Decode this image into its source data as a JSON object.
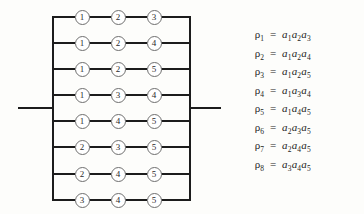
{
  "figure": {
    "type": "series-parallel-circuit-diagram"
  },
  "circuit": {
    "left_terminal_label": "",
    "right_terminal_label": "",
    "columns": 3,
    "rows": [
      {
        "index": 1,
        "nodes": [
          "1",
          "2",
          "3"
        ]
      },
      {
        "index": 2,
        "nodes": [
          "1",
          "2",
          "4"
        ]
      },
      {
        "index": 3,
        "nodes": [
          "1",
          "2",
          "5"
        ]
      },
      {
        "index": 4,
        "nodes": [
          "1",
          "3",
          "4"
        ]
      },
      {
        "index": 5,
        "nodes": [
          "1",
          "4",
          "5"
        ]
      },
      {
        "index": 6,
        "nodes": [
          "2",
          "3",
          "5"
        ]
      },
      {
        "index": 7,
        "nodes": [
          "2",
          "4",
          "5"
        ]
      },
      {
        "index": 8,
        "nodes": [
          "3",
          "4",
          "5"
        ]
      }
    ]
  },
  "equations": [
    {
      "lhs": "ρ",
      "lhs_sub": "1",
      "op": "=",
      "terms": [
        {
          "base": "a",
          "sub": "1"
        },
        {
          "base": "a",
          "sub": "2"
        },
        {
          "base": "a",
          "sub": "3"
        }
      ]
    },
    {
      "lhs": "ρ",
      "lhs_sub": "2",
      "op": "=",
      "terms": [
        {
          "base": "a",
          "sub": "1"
        },
        {
          "base": "a",
          "sub": "2"
        },
        {
          "base": "a",
          "sub": "4"
        }
      ]
    },
    {
      "lhs": "ρ",
      "lhs_sub": "3",
      "op": "=",
      "terms": [
        {
          "base": "a",
          "sub": "1"
        },
        {
          "base": "a",
          "sub": "2"
        },
        {
          "base": "a",
          "sub": "5"
        }
      ]
    },
    {
      "lhs": "ρ",
      "lhs_sub": "4",
      "op": "=",
      "terms": [
        {
          "base": "a",
          "sub": "1"
        },
        {
          "base": "a",
          "sub": "3"
        },
        {
          "base": "a",
          "sub": "4"
        }
      ]
    },
    {
      "lhs": "ρ",
      "lhs_sub": "5",
      "op": "=",
      "terms": [
        {
          "base": "a",
          "sub": "1"
        },
        {
          "base": "a",
          "sub": "4"
        },
        {
          "base": "a",
          "sub": "5"
        }
      ]
    },
    {
      "lhs": "ρ",
      "lhs_sub": "6",
      "op": "=",
      "terms": [
        {
          "base": "a",
          "sub": "2"
        },
        {
          "base": "a",
          "sub": "3"
        },
        {
          "base": "a",
          "sub": "5"
        }
      ]
    },
    {
      "lhs": "ρ",
      "lhs_sub": "7",
      "op": "=",
      "terms": [
        {
          "base": "a",
          "sub": "2"
        },
        {
          "base": "a",
          "sub": "4"
        },
        {
          "base": "a",
          "sub": "5"
        }
      ]
    },
    {
      "lhs": "ρ",
      "lhs_sub": "8",
      "op": "=",
      "terms": [
        {
          "base": "a",
          "sub": "3"
        },
        {
          "base": "a",
          "sub": "4"
        },
        {
          "base": "a",
          "sub": "5"
        }
      ]
    }
  ],
  "colors": {
    "wire": "#1c1c1c",
    "node_outline": "#6e6e6e",
    "node_fill": "#ffffff",
    "text": "#232323",
    "background": "#fdfdfb"
  },
  "geometry": {
    "left_bus_x": 53,
    "right_bus_x": 190,
    "node_columns_x": [
      82,
      118,
      154
    ],
    "row_y": [
      17,
      43,
      69,
      95,
      121,
      147,
      174,
      200
    ],
    "terminal_y": 108,
    "left_lead_start_x": 18,
    "right_lead_end_x": 221
  }
}
